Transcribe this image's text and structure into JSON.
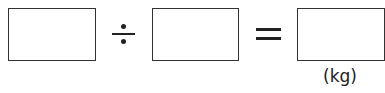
{
  "equation": {
    "operators": {
      "divide": "÷",
      "equals": "="
    },
    "result_unit": "(kg)",
    "boxes": [
      {
        "name": "dividend",
        "value": ""
      },
      {
        "name": "divisor",
        "value": ""
      },
      {
        "name": "quotient",
        "value": ""
      }
    ]
  }
}
